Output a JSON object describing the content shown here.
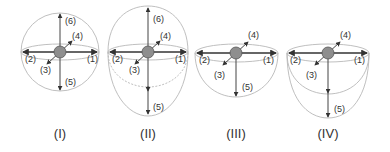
{
  "figure": {
    "panels": [
      {
        "id": "I",
        "caption": "(I)",
        "shape": "sphere",
        "labels": [
          "(1)",
          "(2)",
          "(3)",
          "(4)",
          "(5)",
          "(6)"
        ]
      },
      {
        "id": "II",
        "caption": "(II)",
        "shape": "ellipsoid",
        "labels": [
          "(1)",
          "(2)",
          "(3)",
          "(4)",
          "(5)",
          "(6)"
        ]
      },
      {
        "id": "III",
        "caption": "(III)",
        "shape": "hemisphere",
        "labels": [
          "(1)",
          "(2)",
          "(3)",
          "(4)",
          "(5)"
        ]
      },
      {
        "id": "IV",
        "caption": "(IV)",
        "shape": "semi-ellipsoid",
        "labels": [
          "(1)",
          "(2)",
          "(3)",
          "(4)",
          "(5)"
        ]
      }
    ],
    "colors": {
      "outline": "#b8b8b8",
      "arrow": "#333333",
      "ball": "#8e8e8e",
      "text": "#333333"
    }
  }
}
